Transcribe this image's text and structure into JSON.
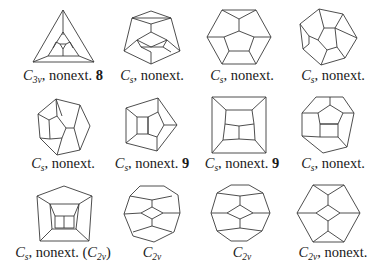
{
  "figure": {
    "panels": [
      {
        "id": 1,
        "sym": "C",
        "sub": "3v",
        "suffix": ", nonext.",
        "num": "8",
        "paren": "",
        "label_x": 63,
        "label_y": 74
      },
      {
        "id": 2,
        "sym": "C",
        "sub": "s",
        "suffix": ", nonext.",
        "num": "",
        "paren": "",
        "label_x": 152,
        "label_y": 74
      },
      {
        "id": 3,
        "sym": "C",
        "sub": "s",
        "suffix": ", nonext.",
        "num": "",
        "paren": "",
        "label_x": 242,
        "label_y": 74
      },
      {
        "id": 4,
        "sym": "C",
        "sub": "s",
        "suffix": ", nonext.",
        "num": "",
        "paren": "",
        "label_x": 333,
        "label_y": 74
      },
      {
        "id": 5,
        "sym": "C",
        "sub": "s",
        "suffix": ", nonext.",
        "num": "",
        "paren": "",
        "label_x": 63,
        "label_y": 161
      },
      {
        "id": 6,
        "sym": "C",
        "sub": "s",
        "suffix": ", nonext.",
        "num": "9",
        "paren": "",
        "label_x": 152,
        "label_y": 161
      },
      {
        "id": 7,
        "sym": "C",
        "sub": "s",
        "suffix": ", nonext.",
        "num": "9",
        "paren": "",
        "label_x": 242,
        "label_y": 161
      },
      {
        "id": 8,
        "sym": "C",
        "sub": "s",
        "suffix": ", nonext.",
        "num": "",
        "paren": "",
        "label_x": 333,
        "label_y": 161
      },
      {
        "id": 9,
        "sym": "C",
        "sub": "s",
        "suffix": ", nonext. (",
        "num": "",
        "paren_sym": "C",
        "paren_sub": "2v",
        "paren_close": ")",
        "label_x": 63,
        "label_y": 250
      },
      {
        "id": 10,
        "sym": "C",
        "sub": "2v",
        "suffix": "",
        "num": "",
        "paren": "",
        "label_x": 152,
        "label_y": 250
      },
      {
        "id": 11,
        "sym": "C",
        "sub": "2v",
        "suffix": "",
        "num": "",
        "paren": "",
        "label_x": 242,
        "label_y": 250
      },
      {
        "id": 12,
        "sym": "C",
        "sub": "2v",
        "suffix": ", nonext.",
        "num": "",
        "paren": "",
        "label_x": 333,
        "label_y": 250
      }
    ],
    "stroke_color": "#3a3a3a",
    "background": "#ffffff"
  }
}
